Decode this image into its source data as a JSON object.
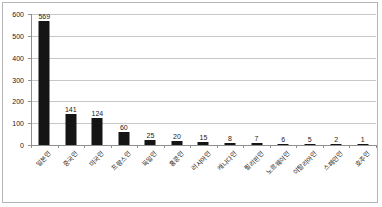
{
  "chart_data": {
    "type": "bar",
    "title": "",
    "xlabel": "",
    "ylabel": "",
    "ylim": [
      0,
      600
    ],
    "ytick_step": 100,
    "grid": true,
    "legend": false,
    "orientation": "vertical",
    "bar_color": "#151515",
    "categories": [
      "일본인",
      "중국인",
      "미국인",
      "프랑스인",
      "독일인",
      "홍콩인",
      "러시아인",
      "캐나다인",
      "필리핀인",
      "노르웨이인",
      "이탈리아인",
      "스페인인",
      "호주인"
    ],
    "values": [
      569,
      141,
      124,
      60,
      25,
      20,
      15,
      8,
      7,
      6,
      5,
      2,
      1
    ],
    "ytick_labels": [
      "0",
      "100",
      "200",
      "300",
      "400",
      "500",
      "600"
    ]
  },
  "style": {
    "axis_color": "#8f8f8f",
    "grid_color": "#c8c8c8",
    "border_color": "#b5b5b5",
    "background": "#ffffff",
    "text_color": "#1a1a1a"
  }
}
